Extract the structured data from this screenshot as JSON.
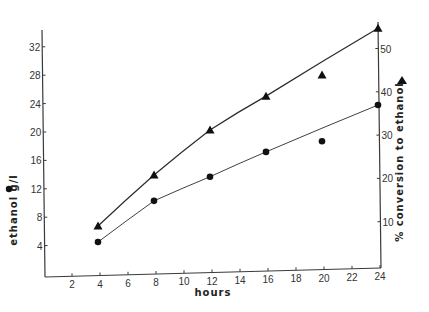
{
  "chart_data": {
    "type": "line",
    "title": "",
    "xlabel": "hours",
    "ylabel": "ethanol g/l",
    "y2label": "% conversion to ethanol",
    "x": [
      4,
      8,
      12,
      16,
      20,
      24
    ],
    "xticks": [
      2,
      4,
      6,
      8,
      10,
      12,
      14,
      16,
      18,
      20,
      22,
      24
    ],
    "yticks": [
      4,
      8,
      12,
      16,
      20,
      24,
      28,
      32
    ],
    "y2ticks": [
      10,
      20,
      30,
      40,
      50
    ],
    "xlim": [
      0,
      24
    ],
    "ylim": [
      0,
      34
    ],
    "y2lim": [
      0,
      56
    ],
    "grid": false,
    "series": [
      {
        "name": "ethanol g/l",
        "marker": "circle",
        "axis": "left",
        "values": [
          4.5,
          10.3,
          13.7,
          17.2,
          18.7,
          23.8
        ]
      },
      {
        "name": "% conversion to ethanol",
        "marker": "triangle",
        "axis": "right",
        "values": [
          9.0,
          20.8,
          31.2,
          39.0,
          43.9,
          54.7
        ]
      }
    ],
    "legend": {
      "left_symbol": "circle (ethanol g/l)",
      "right_symbol": "triangle (% conversion to ethanol)"
    }
  },
  "labels": {
    "x_title": "hours",
    "y_title": "ethanol  g/l",
    "y2_title": "% conversion  to ethanol"
  },
  "colors": {
    "ink": "#111111",
    "axis": "#3a3a3a",
    "background": "#ffffff"
  }
}
